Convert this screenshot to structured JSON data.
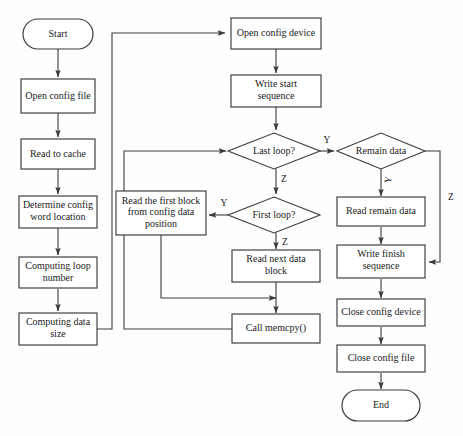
{
  "diagram": {
    "type": "flowchart",
    "width": 463,
    "height": 436,
    "background_color": "#fefefe",
    "line_color": "#3a3a3a",
    "text_color": "#1a1a1a",
    "nodes": [
      {
        "id": "start",
        "label": "Start",
        "shape": "terminator",
        "cx": 58,
        "cy": 34,
        "w": 70,
        "h": 30
      },
      {
        "id": "open_file",
        "label": "Open config file",
        "shape": "process",
        "cx": 58,
        "cy": 96,
        "w": 74,
        "h": 34
      },
      {
        "id": "read_cache",
        "label": "Read to cache",
        "shape": "process",
        "cx": 58,
        "cy": 154,
        "w": 74,
        "h": 30
      },
      {
        "id": "determine",
        "label": "Determine config\nword location",
        "shape": "process",
        "cx": 58,
        "cy": 212,
        "w": 78,
        "h": 32
      },
      {
        "id": "comp_loop",
        "label": "Computing loop\nnumber",
        "shape": "process",
        "cx": 58,
        "cy": 273,
        "w": 78,
        "h": 31
      },
      {
        "id": "comp_size",
        "label": "Computing data\nsize",
        "shape": "process",
        "cx": 58,
        "cy": 329,
        "w": 78,
        "h": 32
      },
      {
        "id": "open_device",
        "label": "Open config device",
        "shape": "process",
        "cx": 276,
        "cy": 33,
        "w": 90,
        "h": 31
      },
      {
        "id": "write_start",
        "label": "Write start\nsequence",
        "shape": "process",
        "cx": 276,
        "cy": 91,
        "w": 90,
        "h": 32
      },
      {
        "id": "last_loop",
        "label": "Last loop?",
        "shape": "decision",
        "cx": 274,
        "cy": 151,
        "w": 92,
        "h": 36
      },
      {
        "id": "first_loop",
        "label": "First loop?",
        "shape": "decision",
        "cx": 274,
        "cy": 215,
        "w": 92,
        "h": 36
      },
      {
        "id": "read_first",
        "label": "Read the first block\nfrom config data\nposition",
        "shape": "process",
        "cx": 161,
        "cy": 213,
        "w": 90,
        "h": 44
      },
      {
        "id": "read_next",
        "label": "Read next data\nblock",
        "shape": "process",
        "cx": 276,
        "cy": 266,
        "w": 88,
        "h": 32
      },
      {
        "id": "call_memcpy",
        "label": "Call memcpy()",
        "shape": "process",
        "cx": 276,
        "cy": 329,
        "w": 88,
        "h": 29
      },
      {
        "id": "remain_data",
        "label": "Remain data",
        "shape": "decision",
        "cx": 381,
        "cy": 151,
        "w": 88,
        "h": 36
      },
      {
        "id": "read_remain",
        "label": "Read remain data",
        "shape": "process",
        "cx": 381,
        "cy": 212,
        "w": 88,
        "h": 29
      },
      {
        "id": "write_finish",
        "label": "Write finish\nsequence",
        "shape": "process",
        "cx": 381,
        "cy": 262,
        "w": 88,
        "h": 33
      },
      {
        "id": "close_device",
        "label": "Close config device",
        "shape": "process",
        "cx": 381,
        "cy": 313,
        "w": 88,
        "h": 27
      },
      {
        "id": "close_file",
        "label": "Close config file",
        "shape": "process",
        "cx": 381,
        "cy": 359,
        "w": 88,
        "h": 27
      },
      {
        "id": "end",
        "label": "End",
        "shape": "terminator",
        "cx": 381,
        "cy": 406,
        "w": 78,
        "h": 31
      }
    ],
    "edge_labels": [
      {
        "id": "last_loop_yes",
        "text": "Y",
        "x": 327,
        "y": 141,
        "rotate": 0
      },
      {
        "id": "last_loop_no",
        "text": "Z",
        "x": 284,
        "y": 180,
        "rotate": 0
      },
      {
        "id": "first_loop_yes",
        "text": "Y",
        "x": 224,
        "y": 204,
        "rotate": 0
      },
      {
        "id": "first_loop_no",
        "text": "Z",
        "x": 285,
        "y": 243,
        "rotate": 0
      },
      {
        "id": "remain_data_yes",
        "text": "Y",
        "x": 389,
        "y": 180,
        "rotate": -80
      },
      {
        "id": "remain_data_no",
        "text": "Z",
        "x": 451,
        "y": 198,
        "rotate": 0
      }
    ]
  }
}
